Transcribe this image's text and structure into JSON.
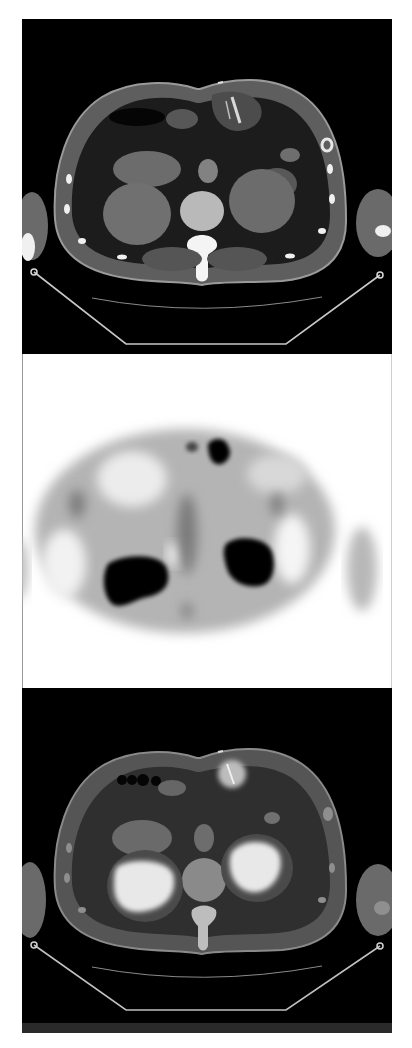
{
  "figure": {
    "layout": "vertical-stack",
    "panels": [
      {
        "id": "ct",
        "modality": "CT axial slice (upper abdomen, kidneys level)",
        "background": "#000000"
      },
      {
        "id": "pet",
        "modality": "PET axial slice (inverted grayscale)",
        "background": "#ffffff"
      },
      {
        "id": "fused",
        "modality": "Fused PET/CT axial slice",
        "background": "#000000"
      }
    ]
  },
  "colors": {
    "ct_background": "#000000",
    "soft_tissue": "#6e6e6e",
    "fat": "#1e1e1e",
    "bone": "#f2f2f2",
    "pet_background": "#ffffff",
    "pet_uptake": "#000000",
    "fused_hotspot": "#e6e6e6"
  }
}
